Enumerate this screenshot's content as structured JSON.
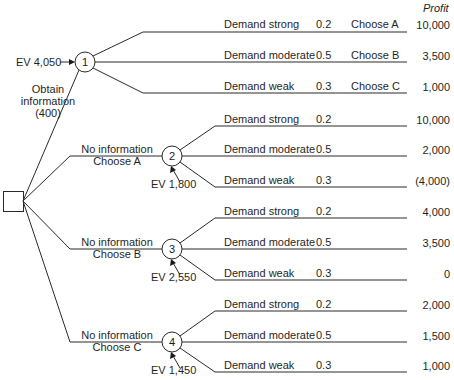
{
  "header": {
    "profit_label": "Profit"
  },
  "decision_node": {
    "shape": "square"
  },
  "branches": {
    "obtain_info": {
      "label_line1": "Obtain",
      "label_line2": "information",
      "label_line3": "(400)"
    },
    "no_info_a": {
      "line1": "No information",
      "line2": "Choose A"
    },
    "no_info_b": {
      "line1": "No information",
      "line2": "Choose B"
    },
    "no_info_c": {
      "line1": "No information",
      "line2": "Choose C"
    }
  },
  "chance_nodes": [
    {
      "id": "1",
      "ev": "EV 4,050"
    },
    {
      "id": "2",
      "ev": "EV 1,800"
    },
    {
      "id": "3",
      "ev": "EV 2,550"
    },
    {
      "id": "4",
      "ev": "EV 1,450"
    }
  ],
  "outcomes": {
    "node1": [
      {
        "demand": "Demand strong",
        "prob": "0.2",
        "choice": "Choose A",
        "profit": "10,000"
      },
      {
        "demand": "Demand moderate",
        "prob": "0.5",
        "choice": "Choose B",
        "profit": "3,500"
      },
      {
        "demand": "Demand weak",
        "prob": "0.3",
        "choice": "Choose C",
        "profit": "1,000"
      }
    ],
    "node2": [
      {
        "demand": "Demand strong",
        "prob": "0.2",
        "profit": "10,000"
      },
      {
        "demand": "Demand moderate",
        "prob": "0.5",
        "profit": "2,000"
      },
      {
        "demand": "Demand weak",
        "prob": "0.3",
        "profit": "(4,000)"
      }
    ],
    "node3": [
      {
        "demand": "Demand strong",
        "prob": "0.2",
        "profit": "4,000"
      },
      {
        "demand": "Demand moderate",
        "prob": "0.5",
        "profit": "3,500"
      },
      {
        "demand": "Demand weak",
        "prob": "0.3",
        "profit": "0"
      }
    ],
    "node4": [
      {
        "demand": "Demand strong",
        "prob": "0.2",
        "profit": "2,000"
      },
      {
        "demand": "Demand moderate",
        "prob": "0.5",
        "profit": "1,500"
      },
      {
        "demand": "Demand weak",
        "prob": "0.3",
        "profit": "1,000"
      }
    ]
  }
}
